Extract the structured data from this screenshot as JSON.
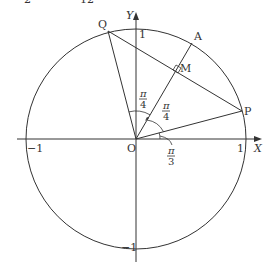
{
  "diagram": {
    "type": "unit-circle-geometry",
    "axes": {
      "x_label": "X",
      "y_label": "Y",
      "origin_label": "O",
      "x_ticks": [
        {
          "value": -1,
          "label": "−1"
        },
        {
          "value": 1,
          "label": "1"
        }
      ],
      "y_ticks": [
        {
          "value": 1,
          "label": "1"
        },
        {
          "value": -1,
          "label": "−1"
        }
      ]
    },
    "circle": {
      "center": "O",
      "radius": 1
    },
    "points": [
      {
        "name": "P",
        "label": "P",
        "angle": "π/12"
      },
      {
        "name": "A",
        "label": "A",
        "angle": "π/3"
      },
      {
        "name": "Q",
        "label": "Q",
        "angle": "7π/12"
      },
      {
        "name": "M",
        "label": "M",
        "description": "midpoint of PQ, foot of perpendicular from O"
      }
    ],
    "segments": [
      "OP",
      "OQ",
      "OA",
      "PQ"
    ],
    "angle_labels": [
      {
        "id": "angle-qoa",
        "numerator": "π",
        "denominator": "4",
        "between": "OQ, OA"
      },
      {
        "id": "angle-aop",
        "numerator": "π",
        "denominator": "4",
        "between": "OA, OP"
      },
      {
        "id": "angle-xoa",
        "numerator": "π",
        "denominator": "3",
        "between": "OX, OA"
      }
    ],
    "right_angle_marker": "M",
    "top_residual_text": [
      "2",
      "12"
    ]
  }
}
